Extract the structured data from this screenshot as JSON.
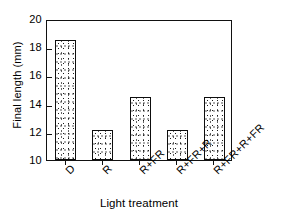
{
  "chart_data": {
    "type": "bar",
    "title": "",
    "xlabel": "Light treatment",
    "ylabel": "Final length  (mm)",
    "categories": [
      "D",
      "R",
      "R+FR",
      "R+FR+R",
      "R+FR+R+FR"
    ],
    "values": [
      18.5,
      12.1,
      14.5,
      12.1,
      14.5
    ],
    "ylim": [
      10,
      20
    ],
    "yticks": [
      10,
      12,
      14,
      16,
      18,
      20
    ],
    "ytick_labels": [
      "10",
      "12",
      "14",
      "16",
      "18",
      "20"
    ],
    "grid": false,
    "legend": "none",
    "series": [
      {
        "name": "Final length",
        "values": [
          18.5,
          12.1,
          14.5,
          12.1,
          14.5
        ]
      }
    ],
    "bar_fill": "stipple",
    "bar_edge_color": "#0d0d0d",
    "axis_color": "#111111",
    "background_color": "#ffffff",
    "xtick_label_rotation": -45
  }
}
